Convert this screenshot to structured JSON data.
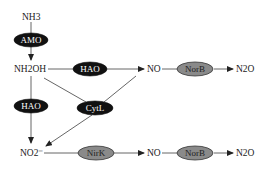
{
  "compounds": {
    "nh3": "NH3",
    "nh2oh": "NH2OH",
    "no_top": "NO",
    "n2o_top": "N2O",
    "no2": "NO2⁻",
    "no_bottom": "NO",
    "n2o_bottom": "N2O"
  },
  "enzymes": {
    "amo": "AMO",
    "hao_top": "HAO",
    "norb_top": "NorB",
    "hao_left": "HAO",
    "cytl": "CytL",
    "nirk": "NirK",
    "norb_bottom": "NorB"
  },
  "colors": {
    "dark_enzyme": "#111111",
    "grey_enzyme": "#8a8a8a",
    "line": "#555555"
  }
}
